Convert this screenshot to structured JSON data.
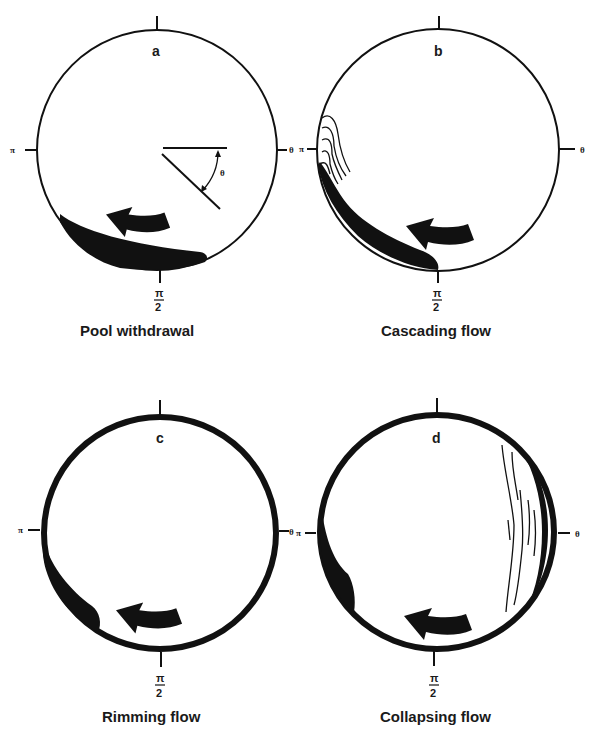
{
  "figure": {
    "panels": [
      {
        "id": "a",
        "letter": "a",
        "caption": "Pool withdrawal",
        "labels": {
          "left": "π",
          "right": "θ",
          "bottom_num": "π",
          "bottom_den": "2"
        },
        "angle_label": "θ"
      },
      {
        "id": "b",
        "letter": "b",
        "caption": "Cascading flow",
        "labels": {
          "left": "π",
          "right": "θ",
          "bottom_num": "π",
          "bottom_den": "2"
        }
      },
      {
        "id": "c",
        "letter": "c",
        "caption": "Rimming flow",
        "labels": {
          "left": "π",
          "right": "θ",
          "bottom_num": "π",
          "bottom_den": "2"
        }
      },
      {
        "id": "d",
        "letter": "d",
        "caption": "Collapsing flow",
        "labels": {
          "left": "π",
          "right": "θ",
          "bottom_num": "π",
          "bottom_den": "2"
        }
      }
    ],
    "colors": {
      "ink": "#111111",
      "background": "#ffffff"
    }
  }
}
